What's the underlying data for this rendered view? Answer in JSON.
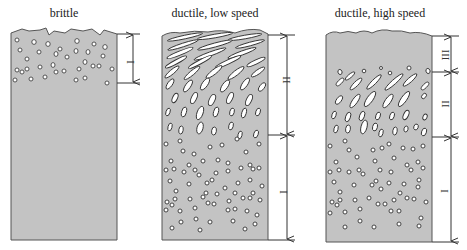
{
  "colors": {
    "specimen_fill": "#c3c3c3",
    "outline": "#555555",
    "void_fill": "#ffffff",
    "line": "#333333"
  },
  "panels": [
    {
      "id": "brittle",
      "title": "brittle",
      "zones": [
        {
          "label": "I",
          "description": "small round voids near fracture surface"
        }
      ]
    },
    {
      "id": "ductile-low",
      "title": "ductile, low speed",
      "zones": [
        {
          "label": "II",
          "description": "elongated sheared voids near surface"
        },
        {
          "label": "I",
          "description": "round voids"
        }
      ]
    },
    {
      "id": "ductile-high",
      "title": "ductile, high speed",
      "zones": [
        {
          "label": "III",
          "description": "void-free layer at surface"
        },
        {
          "label": "II",
          "description": "elongated voids"
        },
        {
          "label": "I",
          "description": "round voids"
        }
      ]
    }
  ]
}
